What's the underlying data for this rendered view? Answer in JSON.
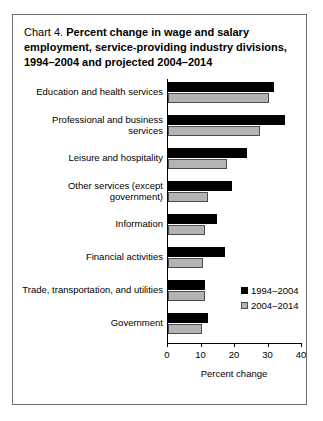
{
  "card": {
    "title_lead": "Chart 4.",
    "title_line1_bold": "Percent change in wage and salary",
    "title_line2": "employment, service-providing industry divisions,",
    "title_line3": "1994–2004 and projected 2004–2014"
  },
  "chart_data": {
    "type": "bar",
    "orientation": "horizontal",
    "title": "Chart 4. Percent change in wage and salary employment, service-providing industry divisions, 1994–2004 and projected 2004–2014",
    "xlabel": "Percent change",
    "ylabel": "",
    "xlim": [
      0,
      40
    ],
    "xticks": [
      0,
      10,
      20,
      30,
      40
    ],
    "xtick_labels": [
      "0",
      "10",
      "20",
      "30",
      "40"
    ],
    "grid": false,
    "legend_position": "lower-right-inside",
    "categories": [
      "Education and health services",
      "Professional and business services",
      "Leisure and hospitality",
      "Other services (except government)",
      "Information",
      "Financial activities",
      "Trade, transportation, and utilities",
      "Government"
    ],
    "category_label_lines": [
      [
        "Education and health services"
      ],
      [
        "Professional and business",
        "services"
      ],
      [
        "Leisure and hospitality"
      ],
      [
        "Other services (except",
        "government)"
      ],
      [
        "Information"
      ],
      [
        "Financial activities"
      ],
      [
        "Trade, transportation, and utilities"
      ],
      [
        "Government"
      ]
    ],
    "series": [
      {
        "name": "1994–2004",
        "color": "#000000",
        "values": [
          31.5,
          35.0,
          23.5,
          19.0,
          14.5,
          17.0,
          11.0,
          12.0
        ]
      },
      {
        "name": "2004–2014",
        "color": "#b3b3b3",
        "values": [
          30.0,
          27.5,
          17.5,
          12.0,
          11.0,
          10.5,
          11.0,
          10.0
        ]
      }
    ]
  }
}
